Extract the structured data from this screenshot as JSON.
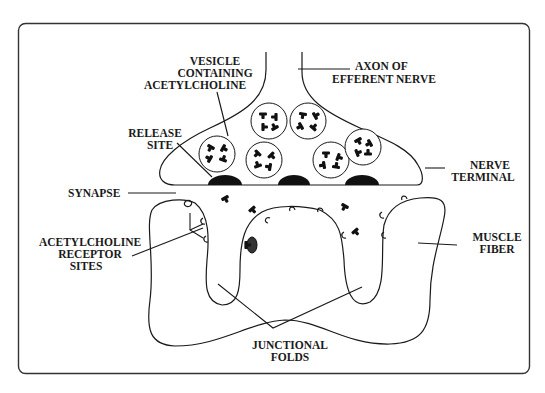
{
  "diagram": {
    "labels": {
      "vesicle": [
        "VESICLE",
        "CONTAINING",
        "ACETYLCHOLINE"
      ],
      "axon": [
        "AXON OF",
        "EFFERENT NERVE"
      ],
      "release_site": [
        "RELEASE",
        "SITE"
      ],
      "nerve_terminal": [
        "NERVE",
        "TERMINAL"
      ],
      "synapse": [
        "SYNAPSE"
      ],
      "receptor_sites": [
        "ACETYLCHOLINE",
        "RECEPTOR",
        "SITES"
      ],
      "muscle_fiber": [
        "MUSCLE",
        "FIBER"
      ],
      "junctional_folds": [
        "JUNCTIONAL",
        "FOLDS"
      ]
    },
    "elements": {
      "vesicle_count": 7,
      "release_site_count": 3,
      "free_acetylcholine_count": 4,
      "bound_acetylcholine_count": 1
    },
    "colors": {
      "ink": "#1a1a1a",
      "background": "#ffffff"
    }
  }
}
